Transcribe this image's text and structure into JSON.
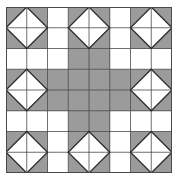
{
  "figure": {
    "title": "",
    "grid": {
      "rows": 8,
      "cols": 8,
      "size_px": 166,
      "line_color": "#4a4a4a",
      "gray_color": "#9b9b9b",
      "white_color": "#ffffff",
      "diamond_stroke": "#2e2e2e",
      "shaded_cells": [
        [
          0,
          0
        ],
        [
          0,
          1
        ],
        [
          1,
          0
        ],
        [
          1,
          1
        ],
        [
          0,
          3
        ],
        [
          0,
          4
        ],
        [
          1,
          3
        ],
        [
          1,
          4
        ],
        [
          0,
          6
        ],
        [
          0,
          7
        ],
        [
          1,
          6
        ],
        [
          1,
          7
        ],
        [
          2,
          3
        ],
        [
          2,
          4
        ],
        [
          3,
          0
        ],
        [
          3,
          1
        ],
        [
          4,
          0
        ],
        [
          4,
          1
        ],
        [
          3,
          2
        ],
        [
          3,
          3
        ],
        [
          3,
          4
        ],
        [
          3,
          5
        ],
        [
          4,
          2
        ],
        [
          4,
          3
        ],
        [
          4,
          4
        ],
        [
          4,
          5
        ],
        [
          3,
          6
        ],
        [
          3,
          7
        ],
        [
          4,
          6
        ],
        [
          4,
          7
        ],
        [
          5,
          3
        ],
        [
          5,
          4
        ],
        [
          6,
          0
        ],
        [
          6,
          1
        ],
        [
          7,
          0
        ],
        [
          7,
          1
        ],
        [
          6,
          3
        ],
        [
          6,
          4
        ],
        [
          7,
          3
        ],
        [
          7,
          4
        ],
        [
          6,
          6
        ],
        [
          6,
          7
        ],
        [
          7,
          6
        ],
        [
          7,
          7
        ]
      ],
      "diamond_blocks": [
        {
          "row": 0,
          "col": 0
        },
        {
          "row": 0,
          "col": 3
        },
        {
          "row": 0,
          "col": 6
        },
        {
          "row": 3,
          "col": 0
        },
        {
          "row": 3,
          "col": 6
        },
        {
          "row": 6,
          "col": 0
        },
        {
          "row": 6,
          "col": 3
        },
        {
          "row": 6,
          "col": 6
        }
      ]
    }
  }
}
